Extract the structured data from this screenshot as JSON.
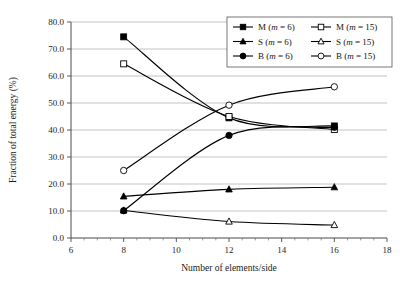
{
  "chart_data": {
    "type": "line",
    "title": "",
    "xlabel": "Number of elements/side",
    "ylabel": "Fraction of total energy (%)",
    "xlim": [
      6,
      18
    ],
    "ylim": [
      0.0,
      80.0
    ],
    "xticks": [
      6,
      8,
      10,
      12,
      14,
      16,
      18
    ],
    "xtick_labels": [
      "6",
      "8",
      "10",
      "12",
      "14",
      "16",
      "18"
    ],
    "yticks": [
      0.0,
      10.0,
      20.0,
      30.0,
      40.0,
      50.0,
      60.0,
      70.0,
      80.0
    ],
    "ytick_labels": [
      "0.0",
      "10.0",
      "20.0",
      "30.0",
      "40.0",
      "50.0",
      "60.0",
      "70.0",
      "80.0"
    ],
    "grid": "horizontal",
    "legend_position": "top-right",
    "x": [
      8,
      12,
      16
    ],
    "series": [
      {
        "name": "M (m = 6)",
        "label_prefix": "M (",
        "label_italic": "m",
        "label_suffix": " = 6)",
        "marker": "filled-square",
        "values": [
          74.5,
          44.5,
          41.5
        ]
      },
      {
        "name": "M (m = 15)",
        "label_prefix": "M (",
        "label_italic": "m",
        "label_suffix": " = 15)",
        "marker": "open-square",
        "values": [
          64.5,
          45.0,
          40.2
        ]
      },
      {
        "name": "S (m = 6)",
        "label_prefix": "S (",
        "label_italic": "m",
        "label_suffix": " = 6)",
        "marker": "filled-triangle",
        "values": [
          15.4,
          18.0,
          18.8
        ]
      },
      {
        "name": "S (m = 15)",
        "label_prefix": "S (",
        "label_italic": "m",
        "label_suffix": " = 15)",
        "marker": "open-triangle",
        "values": [
          10.2,
          6.1,
          4.8
        ]
      },
      {
        "name": "B (m = 6)",
        "label_prefix": "B (",
        "label_italic": "m",
        "label_suffix": " = 6)",
        "marker": "filled-circle",
        "values": [
          10.1,
          38.0,
          41.0
        ]
      },
      {
        "name": "B (m = 15)",
        "label_prefix": "B (",
        "label_italic": "m",
        "label_suffix": " = 15)",
        "marker": "open-circle",
        "values": [
          25.0,
          49.2,
          56.0
        ]
      }
    ]
  }
}
